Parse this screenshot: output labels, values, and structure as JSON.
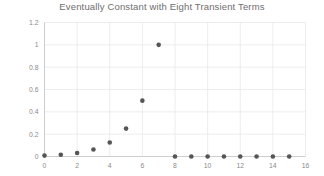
{
  "chart_data": {
    "type": "scatter",
    "title": "Eventually Constant with Eight Transient Terms",
    "xlabel": "",
    "ylabel": "",
    "xlim": [
      0,
      16
    ],
    "ylim": [
      0,
      1.2
    ],
    "grid": true,
    "legend": null,
    "marker_color": "#555555",
    "grid_color": "#e9e9e9",
    "title_color": "#6e6e6e",
    "tick_color": "#8a8a8a",
    "xticks": [
      0,
      2,
      4,
      6,
      8,
      10,
      12,
      14,
      16
    ],
    "xtick_labels": [
      "0",
      "2",
      "4",
      "6",
      "8",
      "10",
      "12",
      "14",
      "16"
    ],
    "yticks": [
      0,
      0.2,
      0.4,
      0.6,
      0.8,
      1,
      1.2
    ],
    "ytick_labels": [
      "0",
      "0.2",
      "0.4",
      "0.6",
      "0.8",
      "1",
      "1.2"
    ],
    "x": [
      0,
      1,
      2,
      3,
      4,
      5,
      6,
      7,
      8,
      9,
      10,
      11,
      12,
      13,
      14,
      15
    ],
    "values": [
      0.008,
      0.016,
      0.031,
      0.063,
      0.125,
      0.25,
      0.5,
      1.0,
      0,
      0,
      0,
      0,
      0,
      0,
      0,
      0
    ]
  }
}
